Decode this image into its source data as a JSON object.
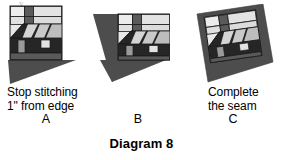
{
  "page": {
    "background_color": "#ffffff",
    "title": "Diagram 8",
    "top_artifact": "y"
  },
  "palette": {
    "fabric_dark": "#4d4d4d",
    "fabric_darker": "#3a3a3a",
    "block_outline": "#1a1a1a",
    "sky_light": "#e8e8e8",
    "sky_light2": "#dcdcdc",
    "window_light": "#e2e2e2",
    "roof_stripe_light": "#d5d5d5",
    "roof_stripe_mid": "#8f8f8f",
    "wall_dark": "#262626",
    "ground_gray": "#5a5a5a",
    "text_color": "#000000"
  },
  "figures": [
    {
      "id": "a",
      "name": "figure-a-house-block-with-triangle",
      "caption_lines": [
        "Stop stitching",
        "1\" from edge"
      ],
      "letter": "A",
      "description": "House quilt block with a dark gray triangle sewn at lower right, stitching stopped 1 inch from edge"
    },
    {
      "id": "b",
      "name": "figure-b-house-block-second-triangle",
      "caption_lines": [],
      "letter": "B",
      "description": "House quilt block with dark triangle added on the left side forming a larger wedge"
    },
    {
      "id": "c",
      "name": "figure-c-house-block-completed-seam",
      "caption_lines": [
        "Complete",
        "the seam"
      ],
      "letter": "C",
      "description": "House quilt block set on point inside a completed dark square frame"
    }
  ]
}
